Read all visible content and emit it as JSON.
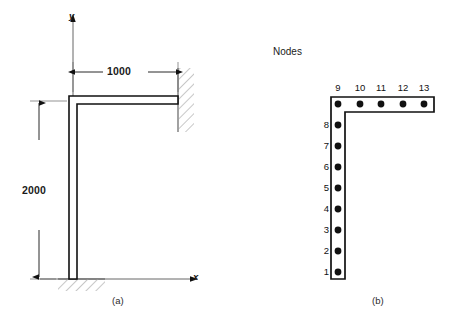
{
  "figure": {
    "background_color": "#ffffff",
    "line_color": "#111111",
    "hatch_color": "#8c8c8c"
  },
  "panel_a": {
    "caption": "(a)",
    "axes": {
      "y_label": "y",
      "x_label": "x"
    },
    "dimensions": [
      {
        "name": "horizontal-span",
        "value": "1000",
        "orientation": "horizontal"
      },
      {
        "name": "vertical-height",
        "value": "2000",
        "orientation": "vertical"
      }
    ],
    "supports": [
      {
        "name": "wall-support",
        "type": "fixed",
        "position": "right"
      },
      {
        "name": "ground-support",
        "type": "fixed",
        "position": "bottom"
      }
    ]
  },
  "panel_b": {
    "title": "Nodes",
    "caption": "(b)",
    "node_count": 13,
    "vertical_nodes": [
      {
        "id": 1,
        "label": "1",
        "x": 338,
        "y": 272
      },
      {
        "id": 2,
        "label": "2",
        "x": 338,
        "y": 251
      },
      {
        "id": 3,
        "label": "3",
        "x": 338,
        "y": 230
      },
      {
        "id": 4,
        "label": "4",
        "x": 338,
        "y": 209
      },
      {
        "id": 5,
        "label": "5",
        "x": 338,
        "y": 188
      },
      {
        "id": 6,
        "label": "6",
        "x": 338,
        "y": 167
      },
      {
        "id": 7,
        "label": "7",
        "x": 338,
        "y": 146
      },
      {
        "id": 8,
        "label": "8",
        "x": 338,
        "y": 125
      },
      {
        "id": 9,
        "label": "9",
        "x": 338,
        "y": 104
      }
    ],
    "horizontal_nodes": [
      {
        "id": 10,
        "label": "10",
        "x": 360,
        "y": 104
      },
      {
        "id": 11,
        "label": "11",
        "x": 381,
        "y": 104
      },
      {
        "id": 12,
        "label": "12",
        "x": 403,
        "y": 104
      },
      {
        "id": 13,
        "label": "13",
        "x": 424,
        "y": 104
      }
    ]
  }
}
